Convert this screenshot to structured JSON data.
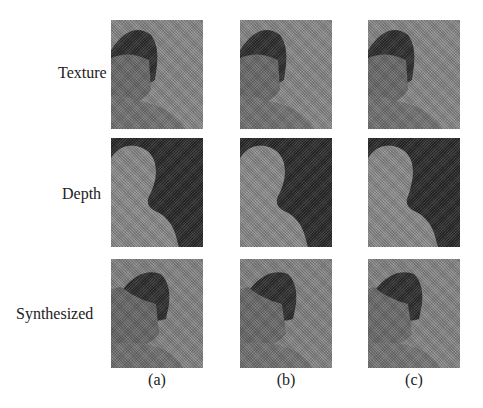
{
  "figure": {
    "rows": [
      {
        "label": "Texture"
      },
      {
        "label": "Depth"
      },
      {
        "label": "Synthesized"
      }
    ],
    "columns": [
      {
        "caption": "(a)"
      },
      {
        "caption": "(b)"
      },
      {
        "caption": "(c)"
      }
    ],
    "colors": {
      "texture_bg": "#8a8a8a",
      "hair": "#2e2e2e",
      "face": "#6e6e6e",
      "depth_bg": "#2a2a2a",
      "depth_fg": "#8c8c8c"
    }
  }
}
